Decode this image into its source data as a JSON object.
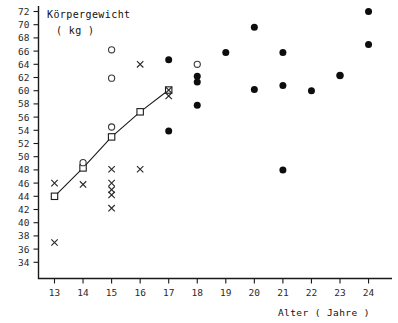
{
  "chart_data": {
    "type": "scatter",
    "title": "",
    "ylabel_line1": "Körpergewicht",
    "ylabel_line2": "( kg )",
    "xlabel": "Alter ( Jahre )",
    "xlim": [
      12.5,
      24.7
    ],
    "ylim": [
      34,
      72
    ],
    "xticks": [
      13,
      14,
      15,
      16,
      17,
      18,
      19,
      20,
      21,
      22,
      23,
      24
    ],
    "yticks": [
      34,
      36,
      38,
      40,
      42,
      44,
      46,
      48,
      50,
      52,
      54,
      56,
      58,
      60,
      62,
      64,
      66,
      68,
      70,
      72
    ],
    "xtick_labels": [
      "13",
      "14",
      "15",
      "16",
      "17",
      "18",
      "19",
      "20",
      "21",
      "22",
      "23",
      "24"
    ],
    "ytick_labels": [
      "34",
      "36",
      "38",
      "40",
      "42",
      "44",
      "46",
      "48",
      "50",
      "52",
      "54",
      "56",
      "58",
      "60",
      "62",
      "64",
      "66",
      "68",
      "70",
      "72"
    ],
    "grid": false,
    "legend": "none",
    "series": [
      {
        "name": "squares-connected",
        "marker": "open-square",
        "connected": true,
        "color": "#1a1a1a",
        "points": [
          {
            "x": 13,
            "y": 44.0
          },
          {
            "x": 14,
            "y": 48.3
          },
          {
            "x": 15,
            "y": 53.0
          },
          {
            "x": 16,
            "y": 56.8
          },
          {
            "x": 17,
            "y": 60.1
          }
        ]
      },
      {
        "name": "open-circles",
        "marker": "open-circle",
        "connected": false,
        "color": "#3a3a3a",
        "points": [
          {
            "x": 14,
            "y": 49.1
          },
          {
            "x": 15,
            "y": 54.5
          },
          {
            "x": 15,
            "y": 61.9
          },
          {
            "x": 15,
            "y": 66.2
          },
          {
            "x": 18,
            "y": 64.0
          },
          {
            "x": 23,
            "y": 62.3
          }
        ]
      },
      {
        "name": "x-markers",
        "marker": "x",
        "connected": false,
        "color": "#2a2a2a",
        "points": [
          {
            "x": 13,
            "y": 46.0
          },
          {
            "x": 13,
            "y": 37.0
          },
          {
            "x": 14,
            "y": 45.8
          },
          {
            "x": 15,
            "y": 48.1
          },
          {
            "x": 15,
            "y": 46.0
          },
          {
            "x": 15,
            "y": 45.0
          },
          {
            "x": 15,
            "y": 44.2
          },
          {
            "x": 15,
            "y": 42.2
          },
          {
            "x": 16,
            "y": 48.1
          },
          {
            "x": 16,
            "y": 64.0
          },
          {
            "x": 17,
            "y": 60.1
          },
          {
            "x": 17,
            "y": 59.2
          }
        ]
      },
      {
        "name": "filled-circles",
        "marker": "filled-circle",
        "connected": false,
        "color": "#0d0d0d",
        "points": [
          {
            "x": 17,
            "y": 64.7
          },
          {
            "x": 17,
            "y": 53.9
          },
          {
            "x": 18,
            "y": 62.2
          },
          {
            "x": 18,
            "y": 61.3
          },
          {
            "x": 18,
            "y": 57.8
          },
          {
            "x": 19,
            "y": 65.8
          },
          {
            "x": 20,
            "y": 69.6
          },
          {
            "x": 20,
            "y": 60.2
          },
          {
            "x": 21,
            "y": 65.8
          },
          {
            "x": 21,
            "y": 60.8
          },
          {
            "x": 21,
            "y": 48.0
          },
          {
            "x": 22,
            "y": 60.0
          },
          {
            "x": 23,
            "y": 62.3
          },
          {
            "x": 24,
            "y": 72.0
          },
          {
            "x": 24,
            "y": 67.0
          }
        ]
      }
    ]
  }
}
